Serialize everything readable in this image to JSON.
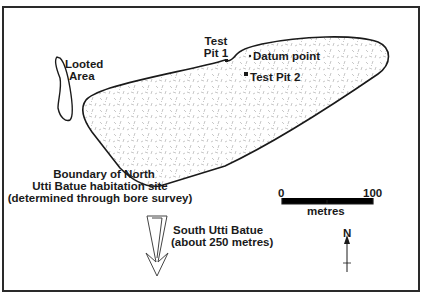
{
  "labels": {
    "looted_area": [
      "Looted",
      "Area"
    ],
    "test_pit_1": [
      "Test",
      "Pit 1"
    ],
    "datum_point": "Datum point",
    "test_pit_2": "Test Pit 2",
    "boundary": [
      "Boundary of North",
      "Utti Batue habitation site",
      "(determined through bore survey)"
    ],
    "south_site": [
      "South Utti Batue",
      "(about 250 metres)"
    ]
  },
  "scale_bar": {
    "min_label": "0",
    "max_label": "100",
    "unit": "metres"
  },
  "north_arrow": {
    "label": "N"
  },
  "colors": {
    "line": "#1a1a1a",
    "stipple": "#b5b5b5",
    "background": "#ffffff"
  }
}
